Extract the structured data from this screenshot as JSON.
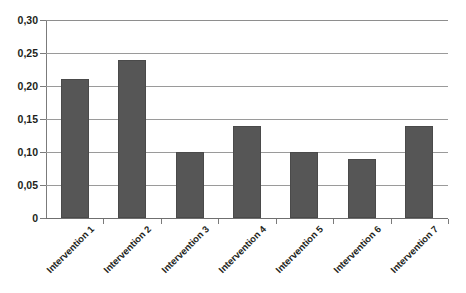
{
  "chart_data": {
    "type": "bar",
    "title": "",
    "subtitle": "",
    "xlabel": "",
    "ylabel": "",
    "categories": [
      "Intervention 1",
      "Intervention 2",
      "Intervention 3",
      "Intervention 4",
      "Intervention 5",
      "Intervention 6",
      "Intervention 7"
    ],
    "values": [
      0.21,
      0.24,
      0.1,
      0.14,
      0.1,
      0.09,
      0.14
    ],
    "ylim": [
      0,
      0.3
    ],
    "ytick_values": [
      0,
      0.05,
      0.1,
      0.15,
      0.2,
      0.25,
      0.3
    ],
    "ytick_labels": [
      "0",
      "0,05",
      "0,10",
      "0,15",
      "0,20",
      "0,25",
      "0,30"
    ],
    "decimal_separator": ",",
    "grid": "horizontal",
    "legend": "none",
    "bar_color": "#565656",
    "gridline_color": "#9a9a9a",
    "axis_color": "#7b7b7b",
    "background_color": "#ffffff",
    "label_rotation_degrees": -45
  }
}
